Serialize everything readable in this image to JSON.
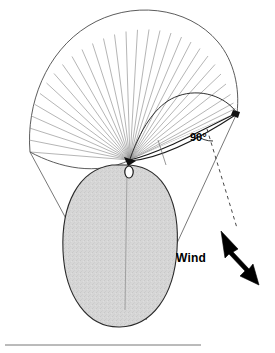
{
  "figure": {
    "background_color": "#ffffff",
    "width": 275,
    "height": 353
  },
  "labels": {
    "angle": "90°",
    "wind": "Wind"
  },
  "colors": {
    "outline": "#1a1a1a",
    "fan_line": "#8c8c8c",
    "canopy_fill": "#d4d4d4",
    "canopy_outline": "#2b2b2b",
    "tip_fill": "#000000",
    "arrow_fill": "#000000",
    "guide_line": "#555555",
    "baseline": "#777777",
    "dashed_line": "#333333"
  },
  "geometry": {
    "hub": {
      "x": 130,
      "y": 160
    },
    "kite_tip": {
      "x": 237,
      "y": 113
    },
    "fan_line_count": 30,
    "fan_radius": 132,
    "fan_start_angle_deg": 188,
    "fan_end_angle_deg": 335,
    "baseline": {
      "x1": 5,
      "y1": 345,
      "x2": 201,
      "y2": 345
    },
    "canopy": {
      "cx": 119,
      "cy": 245,
      "rx": 56,
      "ry": 82
    },
    "wind_arrow": {
      "tip_x": 222,
      "tip_y": 232,
      "tail_x": 258,
      "tail_y": 285
    }
  },
  "annotations": {
    "angle_marker_text": "90°",
    "wind_direction_text": "Wind"
  }
}
